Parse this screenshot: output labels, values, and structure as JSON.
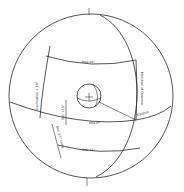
{
  "diagram": {
    "labels": {
      "parallel_top": "Dnk 60°",
      "parallel_equator": "Dnk 0°",
      "parallel_bottom": "Dnk 15°",
      "equator": "Equator",
      "left_declination": "Declination + 60°",
      "right_meridian": "Meridian of Observer",
      "center_declination": "Dec +15°",
      "lower_left": "Dec -15° circle"
    },
    "colors": {
      "line": "#2a2a2a",
      "background": "#ffffff"
    }
  }
}
